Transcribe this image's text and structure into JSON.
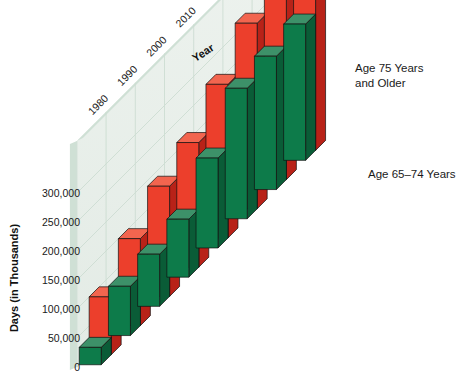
{
  "chart_data": {
    "type": "bar",
    "title": "",
    "subtitle": "",
    "xlabel": "Year",
    "ylabel": "Days (in Thousands)",
    "categories": [
      "1980",
      "1990",
      "2000",
      "2010",
      "2020",
      "2030",
      "2040",
      "2050"
    ],
    "series": [
      {
        "name": "Age 65–74 Years",
        "color": "#0b7a48",
        "values": [
          30000,
          85000,
          90000,
          100000,
          155000,
          225000,
          230000,
          235000
        ]
      },
      {
        "name": "Age 75 Years and Older",
        "color": "#e8402a",
        "values": [
          100000,
          150000,
          190000,
          215000,
          265000,
          320000,
          340000,
          350000
        ]
      }
    ],
    "ytick_labels": [
      "0",
      "50,000",
      "100,000",
      "150,000",
      "200,000",
      "250,000",
      "300,000"
    ],
    "ytick_values": [
      0,
      50000,
      100000,
      150000,
      200000,
      250000,
      300000
    ],
    "ylim": [
      0,
      300000
    ],
    "grid": true,
    "legend_position": "right",
    "projection": "3d-isometric"
  },
  "axes": {
    "y_title": "Days (in Thousands)",
    "x_title": "Year"
  },
  "legend": {
    "items": [
      {
        "label_line1": "Age 75 Years",
        "label_line2": "and Older",
        "color": "#e8402a"
      },
      {
        "label_line1": "Age 65–74 Years",
        "label_line2": "",
        "color": "#0b7a48"
      }
    ]
  },
  "colors": {
    "red_front": "#ec3f2c",
    "red_top": "#f2654f",
    "red_side": "#b82218",
    "green_front": "#0d7b4a",
    "green_top": "#3d9169",
    "green_side": "#0a5c37",
    "wall": "#e9efea",
    "wall_edge": "#c6d8cd",
    "floor": "#ffffff",
    "grid": "#cddcd3",
    "text": "#1a1a1a"
  }
}
